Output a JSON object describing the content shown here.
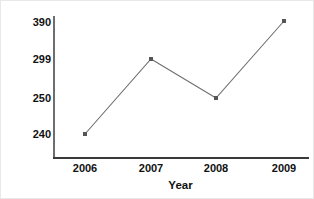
{
  "chart_data": {
    "type": "line",
    "title": "",
    "title_fragment_visible": "",
    "xlabel": "Year",
    "ylabel": "Number of Students Voting",
    "categories": [
      "2006",
      "2007",
      "2008",
      "2009"
    ],
    "values": [
      240,
      299,
      250,
      390
    ],
    "series": [
      {
        "name": "Number of Students Voting",
        "values": [
          240,
          299,
          250,
          390
        ]
      }
    ],
    "ytick_labels": [
      "390",
      "299",
      "250",
      "240"
    ],
    "ytick_values": [
      390,
      299,
      250,
      240
    ],
    "xtick_labels": [
      "2006",
      "2007",
      "2008",
      "2009"
    ],
    "grid": false,
    "legend": "none",
    "marker": "square",
    "line_color": "#707070",
    "marker_color": "#555555",
    "axis_color": "#3a3a3a",
    "text_color": "#111111",
    "background": "#ffffff"
  },
  "axes": {
    "y_title": "Number of Students Voting",
    "x_title": "Year"
  },
  "points": [
    {
      "label": "2006",
      "value": "240",
      "x": 84,
      "y": 133
    },
    {
      "label": "2007",
      "value": "299",
      "x": 150,
      "y": 58
    },
    {
      "label": "2008",
      "value": "250",
      "x": 215,
      "y": 97
    },
    {
      "label": "2009",
      "value": "390",
      "x": 283,
      "y": 20
    }
  ],
  "ylabels": [
    {
      "text": "390",
      "y": 15
    },
    {
      "text": "299",
      "y": 52
    },
    {
      "text": "250",
      "y": 91
    },
    {
      "text": "240",
      "y": 127
    }
  ],
  "xlabels": [
    {
      "text": "2006",
      "x": 84
    },
    {
      "text": "2007",
      "x": 150
    },
    {
      "text": "2008",
      "x": 215
    },
    {
      "text": "2009",
      "x": 283
    }
  ]
}
